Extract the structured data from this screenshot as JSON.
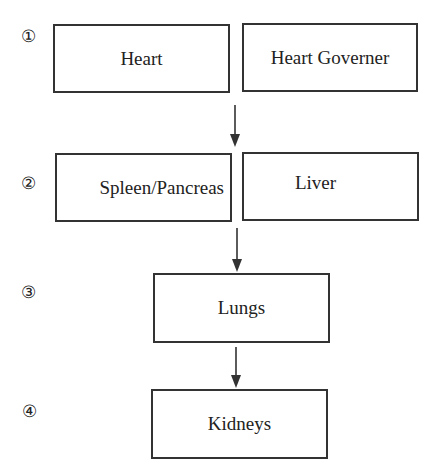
{
  "diagram": {
    "steps": [
      {
        "marker": "①",
        "boxes": [
          "Heart",
          "Heart Governer"
        ]
      },
      {
        "marker": "②",
        "boxes": [
          "Spleen/Pancreas",
          "Liver"
        ]
      },
      {
        "marker": "③",
        "boxes": [
          "Lungs"
        ]
      },
      {
        "marker": "④",
        "boxes": [
          "Kidneys"
        ]
      }
    ],
    "edges": [
      {
        "from": "step 1",
        "to": "step 2"
      },
      {
        "from": "step 2",
        "to": "step 3"
      },
      {
        "from": "step 3",
        "to": "step 4"
      }
    ],
    "colors": {
      "line": "#333333",
      "background": "#ffffff",
      "text": "#222222"
    }
  }
}
